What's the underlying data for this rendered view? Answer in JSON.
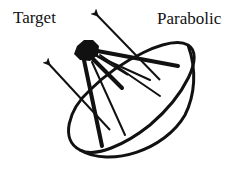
{
  "labels": {
    "target": "Target",
    "parabolic": "Parabolic"
  },
  "colors": {
    "ink": "#111111",
    "background": "#ffffff"
  },
  "components": {
    "target": "target-receiver",
    "dish": "parabolic-dish",
    "struts": "support-struts",
    "rays": "incoming-rays"
  }
}
